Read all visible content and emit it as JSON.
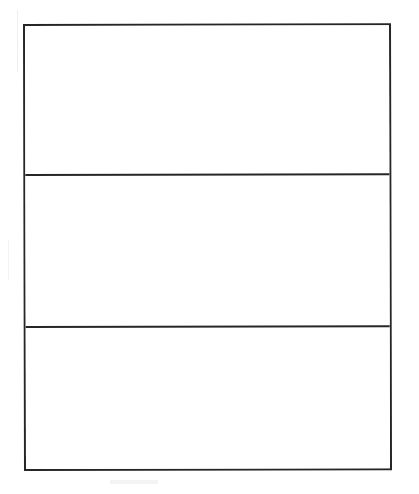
{
  "document": {
    "kind": "line-art-diagram",
    "description": "Blank three-row rectangular frame",
    "background_color": "#ffffff",
    "ink_color": "#262626"
  },
  "frame": {
    "border_color": "#262626",
    "border_width_px": 2,
    "fill_color": "#ffffff",
    "x": 23,
    "y": 24,
    "width": 368,
    "height": 447
  },
  "panels": [
    {
      "id": "panel-1",
      "label": "",
      "content": "",
      "height_px": 148,
      "fill_color": "#ffffff"
    },
    {
      "id": "panel-2",
      "label": "",
      "content": "",
      "height_px": 152,
      "fill_color": "#ffffff"
    },
    {
      "id": "panel-3",
      "label": "",
      "content": "",
      "height_px": 143,
      "fill_color": "#ffffff"
    }
  ],
  "dividers": [
    {
      "id": "divider-1",
      "y": 172,
      "color": "#262626",
      "thickness_px": 2
    },
    {
      "id": "divider-2",
      "y": 324,
      "color": "#262626",
      "thickness_px": 2
    }
  ],
  "artifacts": {
    "note": "faint gray scanner speckles, no legible text"
  }
}
